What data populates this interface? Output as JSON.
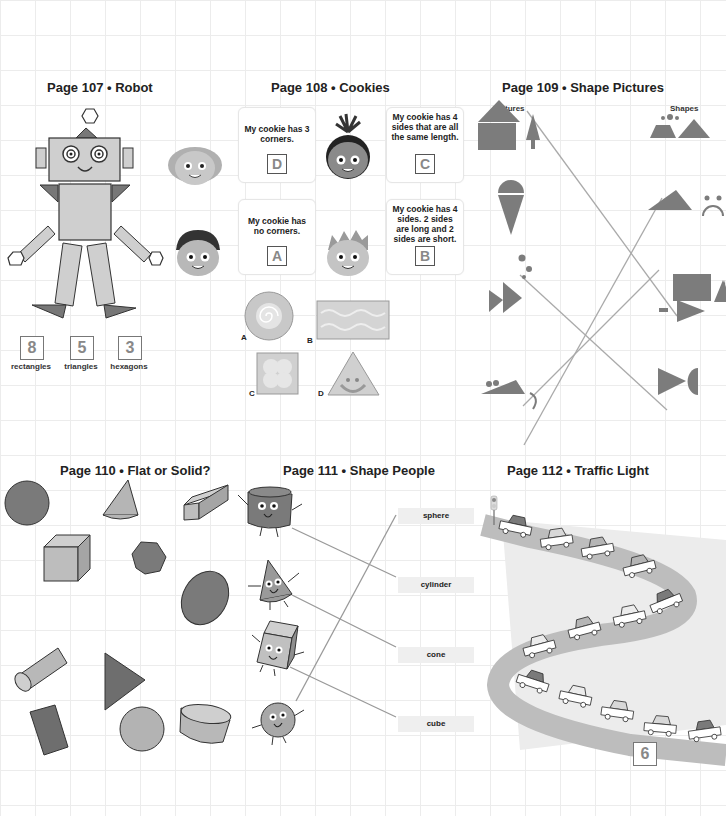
{
  "page_107": {
    "title": "Page 107 • Robot",
    "counts": [
      {
        "value": "8",
        "label": "rectangles"
      },
      {
        "value": "5",
        "label": "triangles"
      },
      {
        "value": "3",
        "label": "hexagons"
      }
    ]
  },
  "page_108": {
    "title": "Page 108 • Cookies",
    "bubbles": [
      {
        "text": "My cookie has 3 corners.",
        "answer": "D"
      },
      {
        "text": "My cookie has 4 sides that are all the same length.",
        "answer": "C"
      },
      {
        "text": "My cookie has no corners.",
        "answer": "A"
      },
      {
        "text": "My cookie has 4 sides. 2 sides are long and 2 sides are short.",
        "answer": "B"
      }
    ],
    "cookies": [
      {
        "letter": "A",
        "shape": "circle"
      },
      {
        "letter": "B",
        "shape": "rectangle"
      },
      {
        "letter": "C",
        "shape": "square"
      },
      {
        "letter": "D",
        "shape": "triangle"
      }
    ]
  },
  "page_109": {
    "title": "Page 109 • Shape Pictures",
    "col_left": "Pictures",
    "col_right": "Shapes",
    "pictures": [
      "house-and-tree",
      "ice-cream-cone",
      "fish",
      "mouse"
    ],
    "shapes": [
      "trapezoid-triangle-dots",
      "triangle-arc-dots",
      "rectangle-triangle",
      "triangle-semicircle"
    ]
  },
  "page_110": {
    "title": "Page 110 • Flat or Solid?",
    "shapes": [
      {
        "name": "circle",
        "kind": "flat"
      },
      {
        "name": "cone",
        "kind": "solid"
      },
      {
        "name": "rectangular-prism",
        "kind": "solid"
      },
      {
        "name": "cube",
        "kind": "solid"
      },
      {
        "name": "hexagon",
        "kind": "flat"
      },
      {
        "name": "oval",
        "kind": "flat"
      },
      {
        "name": "cylinder",
        "kind": "solid"
      },
      {
        "name": "triangle",
        "kind": "flat"
      },
      {
        "name": "rectangle",
        "kind": "flat"
      },
      {
        "name": "sphere",
        "kind": "solid"
      },
      {
        "name": "cylinder-short",
        "kind": "solid"
      }
    ]
  },
  "page_111": {
    "title": "Page 111 • Shape People",
    "words": [
      "sphere",
      "cylinder",
      "cone",
      "cube"
    ],
    "people": [
      "cylinder",
      "cone",
      "cube",
      "sphere"
    ]
  },
  "page_112": {
    "title": "Page 112 • Traffic Light",
    "answer": "6"
  },
  "colors": {
    "dark_fill": "#7c7c7c",
    "mid_fill": "#a9a9a9",
    "light_fill": "#cfcfcf",
    "road": "#bdbdbd",
    "outline": "#3a3a3a"
  }
}
